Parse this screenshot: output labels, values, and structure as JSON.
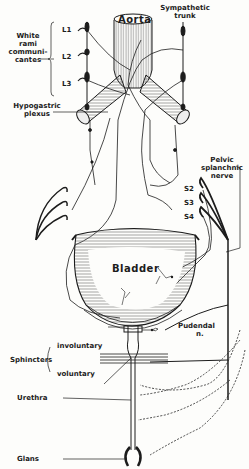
{
  "diagram": {
    "colors": {
      "background": "#fdfdfb",
      "ink": "#1c1c1c",
      "hatch": "#555555"
    },
    "labels": {
      "aorta": "Aorta",
      "sympathetic_trunk_1": "Sympathetic",
      "sympathetic_trunk_2": "trunk",
      "white_rami_1": "White",
      "white_rami_2": "rami",
      "white_rami_3": "communi-",
      "white_rami_4": "cantes",
      "l1": "L1",
      "l2": "L2",
      "l3": "L3",
      "hypogastric_1": "Hypogastric",
      "hypogastric_2": "plexus",
      "pelvic_1": "Pelvic",
      "pelvic_2": "splanchnic",
      "pelvic_3": "nerve",
      "s2": "S2",
      "s3": "S3",
      "s4": "S4",
      "bladder": "Bladder",
      "pudendal_1": "Pudendal",
      "pudendal_2": "n.",
      "sphincters": "Sphincters",
      "involuntary": "involuntary",
      "voluntary": "voluntary",
      "urethra": "Urethra",
      "glans": "Glans"
    }
  }
}
